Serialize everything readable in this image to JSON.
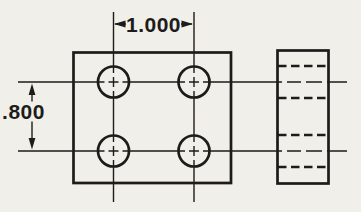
{
  "page": {
    "background_color": "#f1efe9",
    "ink_color": "#1e1c1a"
  },
  "drawing": {
    "front_view": {
      "name": "front-view",
      "hole_count": 4,
      "hole_pattern": "2 x 2 grid with crosshair centerlines"
    },
    "side_view": {
      "name": "right-side-view",
      "hidden_line_count": 4
    },
    "dimensions": {
      "horizontal": {
        "label": "1.000",
        "meaning": "horizontal hole center spacing"
      },
      "vertical": {
        "label": ".800",
        "meaning": "vertical hole center spacing"
      }
    }
  }
}
